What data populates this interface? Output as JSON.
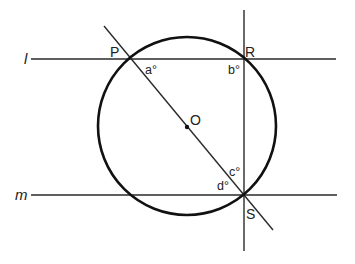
{
  "figure": {
    "type": "geometry-diagram",
    "colors": {
      "stroke": "#2a2a2a",
      "circle": "#111111",
      "text": "#222222",
      "background": "#ffffff"
    },
    "lines": {
      "l": {
        "label": "l",
        "y": 59,
        "x1": 31,
        "x2": 336
      },
      "m": {
        "label": "m",
        "y": 195,
        "x1": 31,
        "x2": 337
      },
      "vertical": {
        "x": 244,
        "y1": 10,
        "y2": 251
      },
      "diagonal": {
        "x1": 104,
        "y1": 26,
        "x2": 273,
        "y2": 230
      }
    },
    "circle": {
      "cx": 187,
      "cy": 126,
      "r": 89
    },
    "points": {
      "P": {
        "label": "P",
        "x": 132,
        "y": 59
      },
      "R": {
        "label": "R",
        "x": 244,
        "y": 59
      },
      "S": {
        "label": "S",
        "x": 244,
        "y": 195
      },
      "O": {
        "label": "O",
        "x": 187,
        "y": 127
      }
    },
    "angles": {
      "a": {
        "label": "a°"
      },
      "b": {
        "label": "b°"
      },
      "c": {
        "label": "c°"
      },
      "d": {
        "label": "d°"
      }
    }
  }
}
